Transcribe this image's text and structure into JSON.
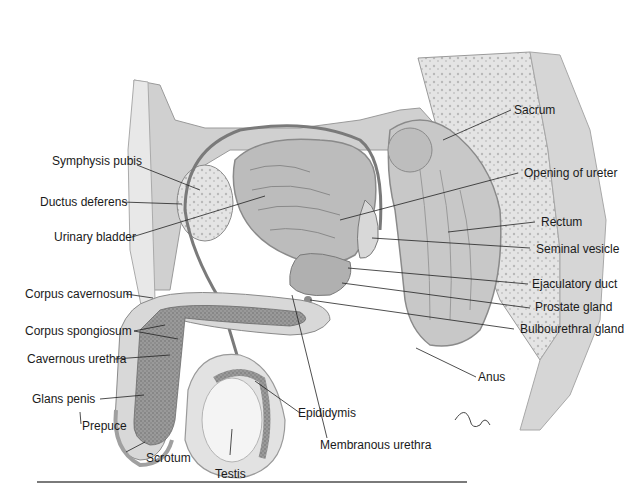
{
  "figure": {
    "colors": {
      "tissue_light": "#e6e6e6",
      "tissue_mid": "#c4c4c4",
      "tissue_dark": "#8e8e8e",
      "outline": "#6a6a6a",
      "leader": "#222222"
    },
    "signature": "tina",
    "labels": {
      "symphysis_pubis": "Symphysis pubis",
      "ductus_deferens": "Ductus deferens",
      "urinary_bladder": "Urinary bladder",
      "corpus_cavernosum": "Corpus cavernosum",
      "corpus_spongiosum": "Corpus spongiosum",
      "cavernous_urethra": "Cavernous urethra",
      "glans_penis": "Glans penis",
      "prepuce": "Prepuce",
      "scrotum": "Scrotum",
      "testis": "Testis",
      "epididymis": "Epididymis",
      "membranous_urethra": "Membranous urethra",
      "sacrum": "Sacrum",
      "opening_of_ureter": "Opening of ureter",
      "rectum": "Rectum",
      "seminal_vesicle": "Seminal vesicle",
      "ejaculatory_duct": "Ejaculatory duct",
      "prostate_gland": "Prostate gland",
      "bulbourethral_gland": "Bulbourethral gland",
      "anus": "Anus"
    }
  }
}
